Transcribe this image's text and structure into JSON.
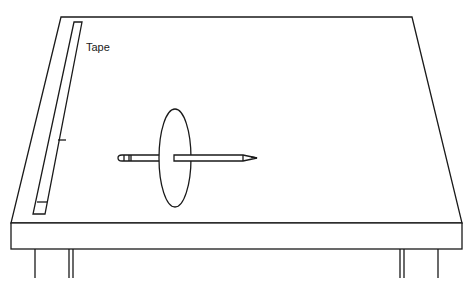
{
  "diagram": {
    "labels": {
      "tape": "Tape"
    },
    "objects": [
      "table",
      "tape",
      "pencil",
      "disk"
    ],
    "colors": {
      "stroke": "#1a1a1a",
      "fill": "#ffffff"
    }
  }
}
